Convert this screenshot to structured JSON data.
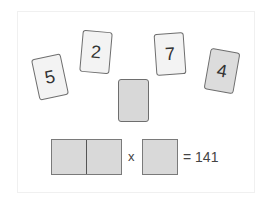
{
  "cards": [
    {
      "value": "5",
      "style": "light"
    },
    {
      "value": "2",
      "style": "light"
    },
    {
      "value": "7",
      "style": "light"
    },
    {
      "value": "4",
      "style": "dark"
    },
    {
      "value": "",
      "style": "blank"
    }
  ],
  "equation": {
    "operator": "x",
    "result": "= 141"
  },
  "colors": {
    "card_light": "#f3f3f3",
    "card_dark": "#dcdcdc",
    "slot": "#d9d9d9",
    "border": "#6e6e6e"
  }
}
